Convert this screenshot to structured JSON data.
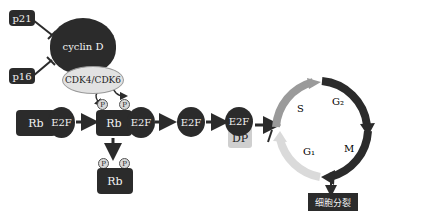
{
  "inhibitors": {
    "p21": "p21",
    "p16": "p16"
  },
  "cyclin": {
    "label": "cyclin D"
  },
  "cdk": {
    "label": "CDK4/CDK6"
  },
  "complex1": {
    "rb": "Rb",
    "e2f": "E2F"
  },
  "complex2": {
    "rb": "Rb",
    "e2f": "E2F",
    "p1": "P",
    "p2": "P"
  },
  "free_rb": {
    "rb": "Rb",
    "p1": "P",
    "p2": "P"
  },
  "free_e2f": {
    "label": "E2F"
  },
  "e2f_dp": {
    "e2f": "E2F",
    "dp": "DP"
  },
  "cycle": {
    "s": "S",
    "g2": "G₂",
    "m": "M",
    "g1": "G₁"
  },
  "outcome": {
    "label": "细胞分裂"
  },
  "colors": {
    "dark": "#2b2b2b",
    "light_gray": "#d0d0d0",
    "s_phase": "#9a9a9a",
    "g1_phase": "#d9d9d9"
  }
}
